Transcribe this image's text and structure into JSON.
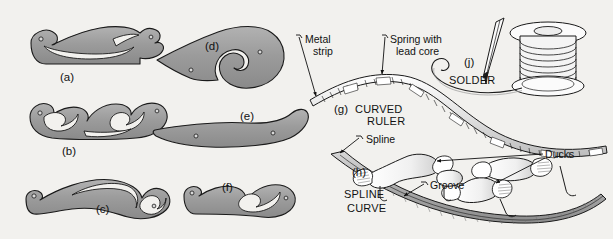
{
  "plate": {
    "title": "Drafting instruments plate",
    "background_color": "#f2f1ee",
    "curve_fill_color": "#9a9a9a",
    "curve_fill_light": "#b4b4b4",
    "outline_color": "#1a1a1a"
  },
  "figures": [
    {
      "id": "a",
      "label": "(a)",
      "name": "french-curve-a",
      "type": "french curve"
    },
    {
      "id": "b",
      "label": "(b)",
      "name": "french-curve-b",
      "type": "french curve"
    },
    {
      "id": "c",
      "label": "(c)",
      "name": "french-curve-c",
      "type": "french curve"
    },
    {
      "id": "d",
      "label": "(d)",
      "name": "french-curve-d",
      "type": "french curve"
    },
    {
      "id": "e",
      "label": "(e)",
      "name": "french-curve-e",
      "type": "french curve"
    },
    {
      "id": "f",
      "label": "(f)",
      "name": "french-curve-f",
      "type": "french curve"
    },
    {
      "id": "g",
      "label": "(g)",
      "name": "curved-ruler",
      "type": "curved ruler"
    },
    {
      "id": "h",
      "label": "(h)",
      "name": "spline-curve",
      "type": "spline curve"
    },
    {
      "id": "j",
      "label": "(j)",
      "name": "solder",
      "type": "solder"
    }
  ],
  "captions": {
    "curved_ruler_line1": "CURVED",
    "curved_ruler_line2": "RULER",
    "spline_curve_line1": "SPLINE",
    "spline_curve_line2": "CURVE",
    "solder": "SOLDER"
  },
  "callouts": {
    "metal_strip_line1": "Metal",
    "metal_strip_line2": "strip",
    "spring_line1": "Spring with",
    "spring_line2": "lead core",
    "spline": "Spline",
    "ducks": "Ducks",
    "groove": "Groove"
  }
}
